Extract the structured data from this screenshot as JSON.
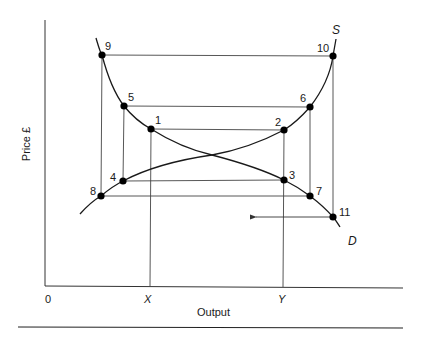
{
  "diagram": {
    "title": "",
    "y_axis_label": "Price £",
    "x_axis_label": "Output",
    "origin_label": "0",
    "x_ticks": [
      {
        "label": "X",
        "x": 150
      },
      {
        "label": "Y",
        "x": 283
      }
    ],
    "curves": [
      {
        "label": "S",
        "name": "supply-curve",
        "color": "#1a1a1a"
      },
      {
        "label": "D",
        "name": "demand-curve",
        "color": "#1a1a1a"
      }
    ],
    "points": [
      {
        "id": "1",
        "x": 151,
        "y": 129
      },
      {
        "id": "2",
        "x": 284,
        "y": 130
      },
      {
        "id": "3",
        "x": 284,
        "y": 180
      },
      {
        "id": "4",
        "x": 123,
        "y": 181
      },
      {
        "id": "5",
        "x": 124,
        "y": 106
      },
      {
        "id": "6",
        "x": 310,
        "y": 107
      },
      {
        "id": "7",
        "x": 310,
        "y": 196
      },
      {
        "id": "8",
        "x": 101,
        "y": 196
      },
      {
        "id": "9",
        "x": 102,
        "y": 55
      },
      {
        "id": "10",
        "x": 333,
        "y": 56
      },
      {
        "id": "11",
        "x": 333,
        "y": 217
      }
    ],
    "arrow": {
      "direction": "left",
      "from_point": "11"
    },
    "line_color": "#333333",
    "dot_color": "#000000"
  }
}
